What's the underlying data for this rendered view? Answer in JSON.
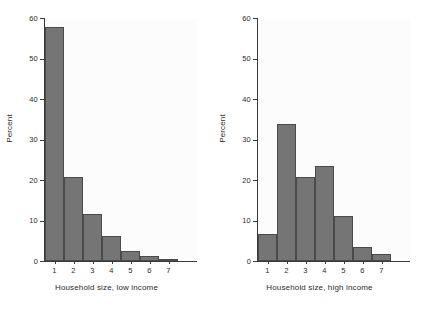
{
  "chart_data": [
    {
      "type": "bar",
      "panel": "left",
      "title": "",
      "xlabel": "Household size, low income",
      "ylabel": "Percent",
      "categories": [
        "1",
        "2",
        "3",
        "4",
        "5",
        "6",
        "7"
      ],
      "values": [
        57.8,
        20.7,
        11.6,
        6.2,
        2.5,
        1.2,
        0.5
      ],
      "xlim": [
        0.5,
        8.5
      ],
      "ylim": [
        0,
        60
      ],
      "yticks": [
        0,
        10,
        20,
        30,
        40,
        50,
        60
      ],
      "ytick_labels": [
        "0",
        "10",
        "20",
        "30",
        "40",
        "50",
        "60"
      ],
      "xticks": [
        1,
        2,
        3,
        4,
        5,
        6,
        7
      ],
      "xtick_labels": [
        "1",
        "2",
        "3",
        "4",
        "5",
        "6",
        "7"
      ],
      "grid": false,
      "legend": false,
      "bar_color": "#757575",
      "bar_edge_color": "#4a4a4a"
    },
    {
      "type": "bar",
      "panel": "right",
      "title": "",
      "xlabel": "Household size, high income",
      "ylabel": "Percent",
      "categories": [
        "1",
        "2",
        "3",
        "4",
        "5",
        "6",
        "7"
      ],
      "values": [
        6.7,
        33.8,
        20.8,
        23.4,
        11.0,
        3.4,
        1.7
      ],
      "xlim": [
        0.5,
        8.5
      ],
      "ylim": [
        0,
        60
      ],
      "yticks": [
        0,
        10,
        20,
        30,
        40,
        50,
        60
      ],
      "ytick_labels": [
        "0",
        "10",
        "20",
        "30",
        "40",
        "50",
        "60"
      ],
      "xticks": [
        1,
        2,
        3,
        4,
        5,
        6,
        7
      ],
      "xtick_labels": [
        "1",
        "2",
        "3",
        "4",
        "5",
        "6",
        "7"
      ],
      "grid": false,
      "legend": false,
      "bar_color": "#757575",
      "bar_edge_color": "#4a4a4a"
    }
  ],
  "figure": {
    "background": "#ffffff",
    "plot_background": "#fcfcfc",
    "axis_color": "#3a3a3a",
    "text_color": "#2b2b2b"
  }
}
